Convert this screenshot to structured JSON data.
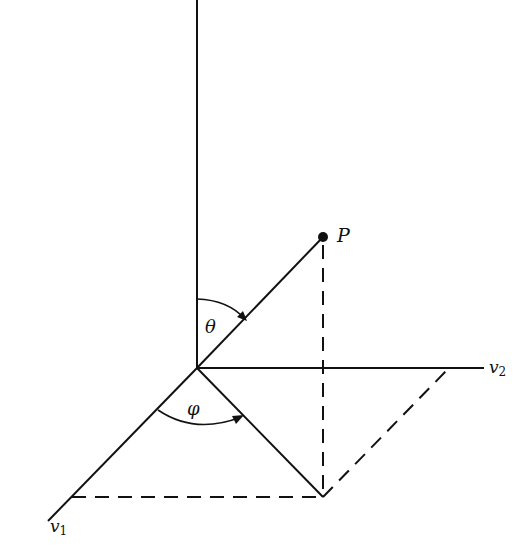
{
  "figure": {
    "type": "spherical coordinates diagram",
    "labels": {
      "point": "P",
      "polar_angle": "θ",
      "azimuthal_angle": "φ",
      "axis_1": "v",
      "axis_1_sub": "1",
      "axis_2": "v",
      "axis_2_sub": "2"
    },
    "colors": {
      "ink": "#111111",
      "background": "#ffffff"
    }
  }
}
